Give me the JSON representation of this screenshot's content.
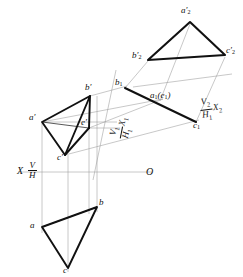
{
  "drawing": {
    "title": "Two successive auxiliary projections of triangle ABC with point E",
    "type": "descriptive-geometry-orthographic-projection",
    "background_color": "#ffffff",
    "ink_color": "#111111",
    "thin_line_color": "#8a8a8a",
    "canvas": {
      "width": 243,
      "height": 277
    }
  },
  "axes": {
    "ground_line": {
      "name": "XO",
      "left_label_x": "X",
      "fraction_numerator": "V",
      "fraction_denominator": "H",
      "right_label": "O",
      "y": 172,
      "x_start": 18,
      "x_end": 152
    },
    "auxiliary_1": {
      "name": "X1",
      "fraction_numerator": "V",
      "fraction_numerator_sub": "1",
      "fraction_denominator": "H",
      "fraction_denominator_sub": "1",
      "tail_label": "X",
      "tail_label_sub": "1",
      "x1": 114,
      "y1": 74,
      "x2": 94,
      "y2": 176
    },
    "auxiliary_2": {
      "name": "X2",
      "fraction_numerator": "V",
      "fraction_numerator_sub": "2",
      "fraction_denominator": "H",
      "fraction_denominator_sub": "1",
      "tail_label": "X",
      "tail_label_sub": "2",
      "x1": 136,
      "y1": 86,
      "x2": 229,
      "y2": 74
    }
  },
  "views": {
    "frontal_view": {
      "name": "V-projection (front view)",
      "points": [
        {
          "id": "a-prime",
          "label": "a",
          "prime": "′",
          "x": 42,
          "y": 122,
          "label_x": 30,
          "label_y": 114
        },
        {
          "id": "b-prime",
          "label": "b",
          "prime": "′",
          "x": 90,
          "y": 96,
          "label_x": 85,
          "label_y": 84
        },
        {
          "id": "c-prime",
          "label": "c",
          "prime": "′",
          "x": 65,
          "y": 155,
          "label_x": 58,
          "label_y": 154
        },
        {
          "id": "e-prime",
          "label": "e",
          "prime": "′",
          "x": 89,
          "y": 128,
          "label_x": 83,
          "label_y": 120
        }
      ],
      "triangle": [
        "a-prime",
        "b-prime",
        "c-prime"
      ],
      "internal_edges": [
        [
          "a-prime",
          "e-prime"
        ],
        [
          "b-prime",
          "e-prime"
        ],
        [
          "c-prime",
          "e-prime"
        ]
      ]
    },
    "horizontal_view": {
      "name": "H-projection (top view)",
      "points": [
        {
          "id": "a",
          "label": "a",
          "x": 42,
          "y": 227,
          "label_x": 31,
          "label_y": 224
        },
        {
          "id": "b",
          "label": "b",
          "x": 97,
          "y": 207,
          "label_x": 99,
          "label_y": 200
        },
        {
          "id": "c",
          "label": "c",
          "x": 68,
          "y": 268,
          "label_x": 64,
          "label_y": 268
        }
      ],
      "triangle": [
        "a",
        "b",
        "c"
      ]
    },
    "auxiliary_view_1": {
      "name": "First auxiliary view (edge view)",
      "points": [
        {
          "id": "b1",
          "label": "b",
          "sub": "1",
          "x": 125,
          "y": 88,
          "label_x": 117,
          "label_y": 80
        },
        {
          "id": "a1e1",
          "label": "a",
          "sub": "1",
          "coincident": "(e",
          "coincident_sub": "1",
          "coincident_close": ")",
          "x": 160,
          "y": 101,
          "label_x": 153,
          "label_y": 93
        },
        {
          "id": "c1",
          "label": "c",
          "sub": "1",
          "x": 196,
          "y": 122,
          "label_x": 194,
          "label_y": 119
        }
      ],
      "edge_line": [
        "b1",
        "c1"
      ]
    },
    "auxiliary_view_2": {
      "name": "Second auxiliary view (true shape)",
      "points": [
        {
          "id": "a2-prime",
          "label": "a",
          "prime": "′",
          "sub": "2",
          "x": 190,
          "y": 22,
          "label_x": 182,
          "label_y": 8
        },
        {
          "id": "b2-prime",
          "label": "b",
          "prime": "′",
          "sub": "2",
          "x": 148,
          "y": 60,
          "label_x": 133,
          "label_y": 52
        },
        {
          "id": "c2-prime",
          "label": "c",
          "prime": "′",
          "sub": "2",
          "x": 225,
          "y": 55,
          "label_x": 226,
          "label_y": 48
        }
      ],
      "triangle": [
        "a2-prime",
        "b2-prime",
        "c2-prime"
      ]
    }
  },
  "projectors": {
    "description": "Thin grey projector / reference lines linking the views",
    "vertical_count": 4,
    "auxiliary_count": 6
  }
}
